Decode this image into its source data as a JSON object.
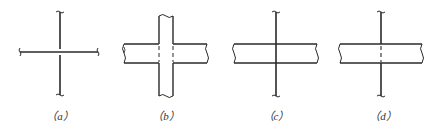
{
  "figure": {
    "type": "pipe-crossing-drawing-conventions",
    "panels": [
      {
        "id": "a",
        "label": "（a）",
        "description": "single-line crossing, both lines solid with break marks"
      },
      {
        "id": "b",
        "label": "（b）",
        "description": "double-line pipes crossing, vertical pipe on top, hidden edges dashed"
      },
      {
        "id": "c",
        "label": "（c）",
        "description": "single-line vertical over double-line horizontal pipe, solid"
      },
      {
        "id": "d",
        "label": "（d）",
        "description": "single-line vertical behind double-line horizontal pipe, dashed inside"
      }
    ],
    "colors": {
      "stroke": "#2a2a2a",
      "label": "#333333",
      "background": "#ffffff"
    }
  }
}
